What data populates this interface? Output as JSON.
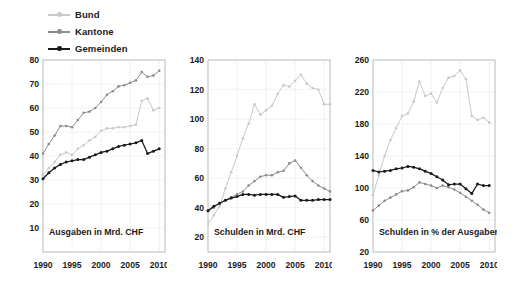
{
  "legend": {
    "items": [
      {
        "label": "Bund",
        "color": "#c9c9c9",
        "icon": "line-marker-icon"
      },
      {
        "label": "Kantone",
        "color": "#8c8c8c",
        "icon": "line-marker-icon"
      },
      {
        "label": "Gemeinden",
        "color": "#1a1a1a",
        "icon": "line-marker-icon"
      }
    ]
  },
  "colors": {
    "bund": "#c9c9c9",
    "kantone": "#8c8c8c",
    "gemeinden": "#1a1a1a",
    "grid": "#dcdcdc",
    "frame": "#9a9a9a",
    "text": "#1b1b1b",
    "background": "#ffffff"
  },
  "chart_data": [
    {
      "type": "line",
      "title": "Ausgaben in Mrd. CHF",
      "xlabel": "",
      "ylabel": "",
      "grid": true,
      "legend_position": "top-left-outside",
      "xlim": [
        1990,
        2011
      ],
      "ylim": [
        0,
        80
      ],
      "xticks": [
        1990,
        1995,
        2000,
        2005,
        2010
      ],
      "yticks": [
        10,
        20,
        30,
        40,
        50,
        60,
        70,
        80
      ],
      "x": [
        1990,
        1991,
        1992,
        1993,
        1994,
        1995,
        1996,
        1997,
        1998,
        1999,
        2000,
        2001,
        2002,
        2003,
        2004,
        2005,
        2006,
        2007,
        2008,
        2009,
        2010
      ],
      "series": [
        {
          "name": "Bund",
          "color": "#c9c9c9",
          "values": [
            32.0,
            35.0,
            37.5,
            40.5,
            41.5,
            40.5,
            43.0,
            44.5,
            46.5,
            48.0,
            50.5,
            51.5,
            51.5,
            52.0,
            52.0,
            52.5,
            53.0,
            63.0,
            64.0,
            59.0,
            60.0
          ]
        },
        {
          "name": "Kantone",
          "color": "#8c8c8c",
          "values": [
            41.0,
            45.0,
            48.5,
            52.5,
            52.5,
            52.0,
            55.0,
            58.0,
            58.5,
            60.0,
            62.5,
            65.5,
            67.0,
            69.0,
            69.5,
            70.5,
            71.5,
            75.0,
            73.0,
            73.5,
            75.5
          ]
        },
        {
          "name": "Gemeinden",
          "color": "#1a1a1a",
          "values": [
            30.5,
            33.0,
            35.0,
            36.5,
            37.5,
            38.0,
            38.5,
            38.5,
            39.5,
            40.5,
            41.5,
            42.0,
            43.0,
            44.0,
            44.5,
            45.0,
            45.5,
            46.5,
            41.0,
            42.0,
            43.0
          ]
        }
      ]
    },
    {
      "type": "line",
      "title": "Schulden in Mrd. CHF",
      "xlabel": "",
      "ylabel": "",
      "grid": true,
      "legend_position": "top-left-outside",
      "xlim": [
        1990,
        2011
      ],
      "ylim": [
        10,
        140
      ],
      "xticks": [
        1990,
        1995,
        2000,
        2005,
        2010
      ],
      "yticks": [
        20,
        40,
        60,
        80,
        100,
        120,
        140
      ],
      "x": [
        1990,
        1991,
        1992,
        1993,
        1994,
        1995,
        1996,
        1997,
        1998,
        1999,
        2000,
        2001,
        2002,
        2003,
        2004,
        2005,
        2006,
        2007,
        2008,
        2009,
        2010,
        2011
      ],
      "series": [
        {
          "name": "Bund",
          "color": "#c9c9c9",
          "values": [
            29.0,
            35.0,
            41.0,
            53.0,
            64.0,
            75.0,
            87.0,
            97.0,
            110.0,
            103.0,
            106.0,
            109.0,
            117.0,
            123.0,
            122.0,
            126.0,
            130.0,
            124.0,
            121.0,
            120.0,
            110.0,
            110.0
          ]
        },
        {
          "name": "Kantone",
          "color": "#8c8c8c",
          "values": [
            38.0,
            40.0,
            43.0,
            45.0,
            47.0,
            49.0,
            51.0,
            55.0,
            58.0,
            61.0,
            62.0,
            62.0,
            64.0,
            65.0,
            70.0,
            72.0,
            67.0,
            62.0,
            58.0,
            55.0,
            53.0,
            51.0
          ]
        },
        {
          "name": "Gemeinden",
          "color": "#1a1a1a",
          "values": [
            38.0,
            41.0,
            43.0,
            45.0,
            46.5,
            47.5,
            49.0,
            49.0,
            48.5,
            49.0,
            49.0,
            49.0,
            49.0,
            47.0,
            47.5,
            48.0,
            45.0,
            45.0,
            45.0,
            45.5,
            45.5,
            45.5
          ]
        }
      ]
    },
    {
      "type": "line",
      "title": "Schulden in % der Ausgaben",
      "xlabel": "",
      "ylabel": "",
      "grid": true,
      "legend_position": "top-left-outside",
      "xlim": [
        1990,
        2011
      ],
      "ylim": [
        20,
        260
      ],
      "xticks": [
        1990,
        1995,
        2000,
        2005,
        2010
      ],
      "yticks": [
        20,
        60,
        100,
        140,
        180,
        220,
        260
      ],
      "x": [
        1990,
        1991,
        1992,
        1993,
        1994,
        1995,
        1996,
        1997,
        1998,
        1999,
        2000,
        2001,
        2002,
        2003,
        2004,
        2005,
        2006,
        2007,
        2008,
        2009,
        2010
      ],
      "series": [
        {
          "name": "Bund",
          "color": "#c9c9c9",
          "values": [
            91.0,
            116.0,
            140.0,
            160.0,
            175.0,
            190.0,
            193.0,
            208.0,
            233.0,
            215.0,
            218.0,
            207.0,
            225.0,
            238.0,
            240.0,
            247.0,
            236.0,
            190.0,
            185.0,
            188.0,
            182.0
          ]
        },
        {
          "name": "Kantone",
          "color": "#8c8c8c",
          "values": [
            72.0,
            78.0,
            84.0,
            88.0,
            92.0,
            96.0,
            97.0,
            101.0,
            107.0,
            105.0,
            103.0,
            100.0,
            103.0,
            101.0,
            98.0,
            94.0,
            89.0,
            84.0,
            79.0,
            73.0,
            69.0
          ]
        },
        {
          "name": "Gemeinden",
          "color": "#1a1a1a",
          "values": [
            122.0,
            120.0,
            121.0,
            122.0,
            124.0,
            125.0,
            127.0,
            126.0,
            124.0,
            121.0,
            118.0,
            114.0,
            110.0,
            104.0,
            105.0,
            105.0,
            99.0,
            93.0,
            105.0,
            103.0,
            103.0
          ]
        }
      ]
    }
  ]
}
